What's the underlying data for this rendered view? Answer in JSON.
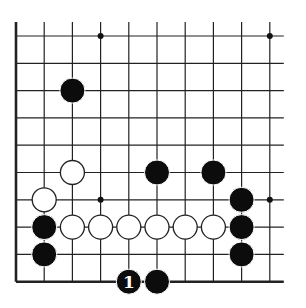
{
  "diagram": {
    "type": "go-board-fragment",
    "columns": 10,
    "rows": 10,
    "grid_origin_x": 16,
    "grid_origin_y": 36,
    "spacing_x": 28.2,
    "spacing_y": 27.3,
    "line_color": "#222222",
    "edges": [
      "left",
      "bottom"
    ],
    "star_points": [
      [
        3,
        0
      ],
      [
        9,
        0
      ],
      [
        3,
        6
      ],
      [
        9,
        6
      ]
    ],
    "stones": [
      {
        "color": "black",
        "col": 2,
        "row": 2
      },
      {
        "color": "white",
        "col": 2,
        "row": 5
      },
      {
        "color": "black",
        "col": 5,
        "row": 5
      },
      {
        "color": "black",
        "col": 7,
        "row": 5
      },
      {
        "color": "white",
        "col": 1,
        "row": 6
      },
      {
        "color": "black",
        "col": 8,
        "row": 6
      },
      {
        "color": "black",
        "col": 1,
        "row": 7
      },
      {
        "color": "white",
        "col": 2,
        "row": 7
      },
      {
        "color": "white",
        "col": 3,
        "row": 7
      },
      {
        "color": "white",
        "col": 4,
        "row": 7
      },
      {
        "color": "white",
        "col": 5,
        "row": 7
      },
      {
        "color": "white",
        "col": 6,
        "row": 7
      },
      {
        "color": "white",
        "col": 7,
        "row": 7
      },
      {
        "color": "black",
        "col": 8,
        "row": 7
      },
      {
        "color": "black",
        "col": 1,
        "row": 8
      },
      {
        "color": "black",
        "col": 8,
        "row": 8
      },
      {
        "color": "black",
        "col": 4,
        "row": 9,
        "label": "1"
      },
      {
        "color": "black",
        "col": 5,
        "row": 9
      }
    ]
  }
}
